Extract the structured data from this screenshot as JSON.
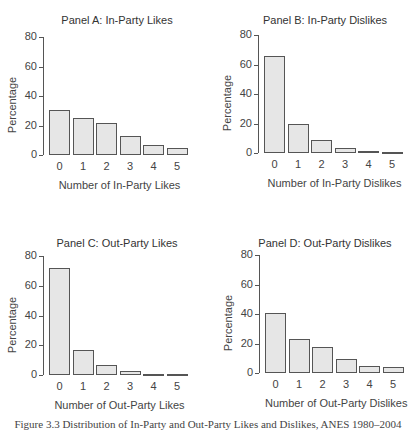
{
  "chart_data": [
    {
      "type": "bar",
      "title": "Panel A: In-Party Likes",
      "xlabel": "Number of In-Party Likes",
      "ylabel": "Percentage",
      "categories": [
        "0",
        "1",
        "2",
        "3",
        "4",
        "5"
      ],
      "values": [
        30.5,
        25,
        21.5,
        13,
        6.5,
        5
      ],
      "ylim": [
        0,
        80
      ],
      "yticks": [
        "0",
        "20",
        "40",
        "60",
        "80"
      ],
      "grid": false
    },
    {
      "type": "bar",
      "title": "Panel B: In-Party Dislikes",
      "xlabel": "Number of In-Party Dislikes",
      "ylabel": "Percentage",
      "categories": [
        "0",
        "1",
        "2",
        "3",
        "4",
        "5"
      ],
      "values": [
        65.5,
        20,
        9,
        3.5,
        1.3,
        0.4
      ],
      "ylim": [
        0,
        80
      ],
      "yticks": [
        "0",
        "20",
        "40",
        "60",
        "80"
      ],
      "grid": false
    },
    {
      "type": "bar",
      "title": "Panel C: Out-Party Likes",
      "xlabel": "Number of Out-Party Likes",
      "ylabel": "Percentage",
      "categories": [
        "0",
        "1",
        "2",
        "3",
        "4",
        "5"
      ],
      "values": [
        72,
        16.5,
        7,
        3,
        1,
        1
      ],
      "ylim": [
        0,
        80
      ],
      "yticks": [
        "0",
        "20",
        "40",
        "60",
        "80"
      ],
      "grid": false
    },
    {
      "type": "bar",
      "title": "Panel D: Out-Party Dislikes",
      "xlabel": "Number of Out-Party Dislikes",
      "ylabel": "Percentage",
      "categories": [
        "0",
        "1",
        "2",
        "3",
        "4",
        "5"
      ],
      "values": [
        40.5,
        23,
        17.5,
        9.5,
        4.7,
        4.3
      ],
      "ylim": [
        0,
        80
      ],
      "yticks": [
        "0",
        "20",
        "40",
        "60",
        "80"
      ],
      "grid": false
    }
  ],
  "caption": "Figure 3.3 Distribution of In-Party and Out-Party Likes and Dislikes, ANES 1980–2004",
  "colors": {
    "bar_fill": "#e6e6e6",
    "bar_border": "#555555",
    "text": "#444444"
  }
}
